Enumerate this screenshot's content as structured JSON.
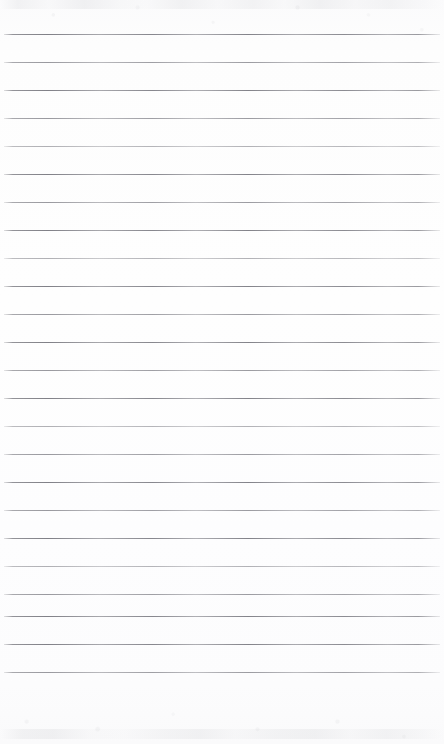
{
  "document": {
    "type": "scanned-ruled-notebook-page",
    "title": "Blank ruled notebook page",
    "orientation": "portrait",
    "page_width": 444,
    "page_height": 744,
    "has_text": false,
    "has_handwriting": false,
    "has_margin_rule": false,
    "has_header": false,
    "has_footer": false,
    "body_text": ""
  },
  "paper": {
    "background_color": "#fdfdfd",
    "edge_color": "#fafafb",
    "grain_color": "#9a9ca2"
  },
  "ruling": {
    "line_color": "#86868d",
    "line_count": 24,
    "line_thickness_px": 1,
    "line_spacing_px": 28,
    "first_line_y": 34,
    "last_line_y": 672,
    "line_start_x": 4,
    "line_end_x": 440,
    "lines": [
      {
        "index": 1,
        "y": 34,
        "tone": "dark"
      },
      {
        "index": 2,
        "y": 62,
        "tone": "mid"
      },
      {
        "index": 3,
        "y": 90,
        "tone": "dark"
      },
      {
        "index": 4,
        "y": 118,
        "tone": "mid"
      },
      {
        "index": 5,
        "y": 146,
        "tone": "faint"
      },
      {
        "index": 6,
        "y": 174,
        "tone": "dark"
      },
      {
        "index": 7,
        "y": 202,
        "tone": "mid"
      },
      {
        "index": 8,
        "y": 230,
        "tone": "dark"
      },
      {
        "index": 9,
        "y": 258,
        "tone": "faint"
      },
      {
        "index": 10,
        "y": 286,
        "tone": "dark"
      },
      {
        "index": 11,
        "y": 314,
        "tone": "mid"
      },
      {
        "index": 12,
        "y": 342,
        "tone": "dark"
      },
      {
        "index": 13,
        "y": 370,
        "tone": "mid"
      },
      {
        "index": 14,
        "y": 398,
        "tone": "dark"
      },
      {
        "index": 15,
        "y": 426,
        "tone": "faint"
      },
      {
        "index": 16,
        "y": 454,
        "tone": "mid"
      },
      {
        "index": 17,
        "y": 482,
        "tone": "dark"
      },
      {
        "index": 18,
        "y": 510,
        "tone": "mid"
      },
      {
        "index": 19,
        "y": 538,
        "tone": "dark"
      },
      {
        "index": 20,
        "y": 566,
        "tone": "faint"
      },
      {
        "index": 21,
        "y": 594,
        "tone": "mid"
      },
      {
        "index": 22,
        "y": 616,
        "tone": "dark"
      },
      {
        "index": 23,
        "y": 644,
        "tone": "dark"
      },
      {
        "index": 24,
        "y": 672,
        "tone": "mid"
      }
    ]
  },
  "footer_area": {
    "blank_height_px": 72,
    "content": ""
  }
}
